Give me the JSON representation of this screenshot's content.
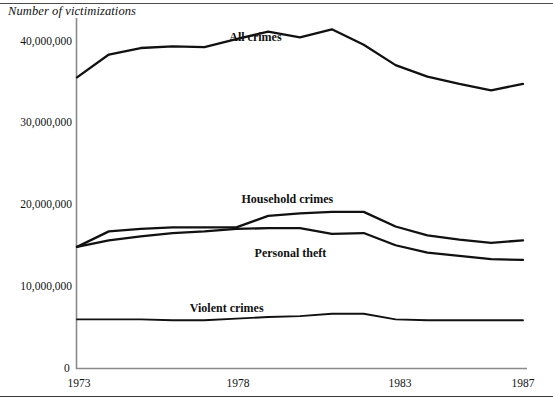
{
  "figure": {
    "axis_title": "Number of victimizations",
    "y_ticks": [
      "40,000,000",
      "30,000,000",
      "20,000,000",
      "10,000,000"
    ],
    "y_zero": "0",
    "x_ticks": [
      "1973",
      "1978",
      "1983",
      "1987"
    ],
    "line_color": "#111111",
    "axis_color": "#7a7a7a"
  },
  "chart_data": {
    "type": "line",
    "title": "",
    "xlabel": "",
    "ylabel": "Number of victimizations",
    "xlim": [
      1973,
      1987
    ],
    "ylim": [
      0,
      44000000
    ],
    "yticks": [
      10000000,
      20000000,
      30000000,
      40000000
    ],
    "ytick_labels": [
      "10,000,000",
      "20,000,000",
      "30,000,000",
      "40,000,000"
    ],
    "xticks": [
      1973,
      1978,
      1983,
      1987
    ],
    "xtick_labels": [
      "1973",
      "1978",
      "1983",
      "1987"
    ],
    "grid": false,
    "legend": "inline-labels",
    "x": [
      1973,
      1974,
      1975,
      1976,
      1977,
      1978,
      1979,
      1980,
      1981,
      1982,
      1983,
      1984,
      1985,
      1986,
      1987
    ],
    "series": [
      {
        "name": "All crimes",
        "label_position": {
          "x": 1978.6,
          "y": 40500000
        },
        "values": [
          35600000,
          38400000,
          39200000,
          39400000,
          39300000,
          40300000,
          41200000,
          40500000,
          41500000,
          39600000,
          37100000,
          35700000,
          34800000,
          34000000,
          34800000
        ]
      },
      {
        "name": "Household crimes",
        "label_position": {
          "x": 1979.6,
          "y": 20700000
        },
        "values": [
          14800000,
          16700000,
          17000000,
          17200000,
          17200000,
          17200000,
          18600000,
          18900000,
          19100000,
          19100000,
          17300000,
          16200000,
          15700000,
          15300000,
          15600000
        ]
      },
      {
        "name": "Personal theft",
        "label_position": {
          "x": 1979.7,
          "y": 14100000
        },
        "values": [
          14800000,
          15600000,
          16100000,
          16500000,
          16700000,
          17000000,
          17100000,
          17100000,
          16400000,
          16500000,
          15000000,
          14100000,
          13700000,
          13300000,
          13200000
        ]
      },
      {
        "name": "Violent crimes",
        "label_position": {
          "x": 1977.7,
          "y": 7300000
        },
        "values": [
          5900000,
          5900000,
          5900000,
          5800000,
          5800000,
          6000000,
          6200000,
          6300000,
          6600000,
          6600000,
          5900000,
          5800000,
          5800000,
          5800000,
          5800000
        ]
      }
    ]
  }
}
